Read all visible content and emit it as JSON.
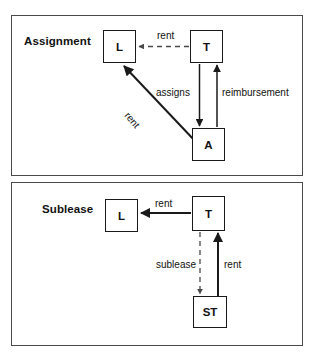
{
  "diagram": {
    "title_hidden": "",
    "panels": [
      {
        "id": "assignment",
        "title": "Assignment",
        "nodes": [
          {
            "id": "L",
            "label": "L"
          },
          {
            "id": "T",
            "label": "T"
          },
          {
            "id": "A",
            "label": "A"
          }
        ],
        "edges": [
          {
            "from": "T",
            "to": "L",
            "label": "rent",
            "style": "dashed",
            "direction": "left"
          },
          {
            "from": "T",
            "to": "A",
            "label": "assigns",
            "style": "solid",
            "direction": "down"
          },
          {
            "from": "A",
            "to": "T",
            "label": "reimbursement",
            "style": "solid",
            "direction": "up"
          },
          {
            "from": "A",
            "to": "L",
            "label": "rent",
            "style": "solid",
            "direction": "diagonal-up-left"
          }
        ]
      },
      {
        "id": "sublease",
        "title": "Sublease",
        "nodes": [
          {
            "id": "L",
            "label": "L"
          },
          {
            "id": "T",
            "label": "T"
          },
          {
            "id": "ST",
            "label": "ST"
          }
        ],
        "edges": [
          {
            "from": "T",
            "to": "L",
            "label": "rent",
            "style": "solid",
            "direction": "left"
          },
          {
            "from": "T",
            "to": "ST",
            "label": "sublease",
            "style": "dashed",
            "direction": "down"
          },
          {
            "from": "ST",
            "to": "T",
            "label": "rent",
            "style": "solid",
            "direction": "up"
          }
        ]
      }
    ],
    "colors": {
      "frame": "#4a4a4a",
      "node_border": "#1a1a1a",
      "line": "#1a1a1a",
      "dashed_line": "#555555",
      "text": "#111111",
      "background": "#ffffff"
    }
  }
}
